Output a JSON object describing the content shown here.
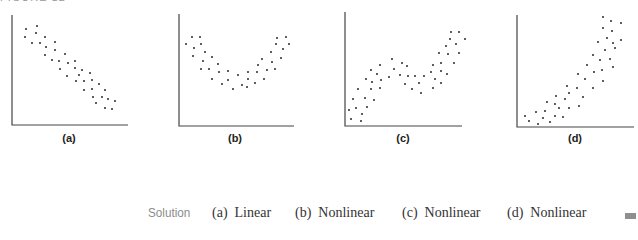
{
  "figure": {
    "title": "FIGURE 12"
  },
  "chart_data": [
    {
      "type": "scatter",
      "panel": "(a)",
      "title": "",
      "xlabel": "",
      "ylabel": "",
      "grid": false,
      "axis": {
        "origin": [
          12,
          125
        ],
        "x_end": 128,
        "y_top": 15
      },
      "trend": "negative linear",
      "points": [
        [
          26,
          29
        ],
        [
          37,
          26
        ],
        [
          25,
          37
        ],
        [
          36,
          33
        ],
        [
          32,
          43
        ],
        [
          40,
          43
        ],
        [
          45,
          37
        ],
        [
          46,
          47
        ],
        [
          55,
          42
        ],
        [
          45,
          55
        ],
        [
          55,
          50
        ],
        [
          52,
          60
        ],
        [
          59,
          61
        ],
        [
          65,
          54
        ],
        [
          68,
          63
        ],
        [
          75,
          61
        ],
        [
          60,
          69
        ],
        [
          75,
          68
        ],
        [
          82,
          70
        ],
        [
          67,
          76
        ],
        [
          79,
          75
        ],
        [
          90,
          73
        ],
        [
          76,
          81
        ],
        [
          84,
          81
        ],
        [
          92,
          80
        ],
        [
          99,
          84
        ],
        [
          84,
          90
        ],
        [
          92,
          89
        ],
        [
          105,
          90
        ],
        [
          93,
          97
        ],
        [
          102,
          97
        ],
        [
          108,
          99
        ],
        [
          115,
          101
        ],
        [
          96,
          103
        ],
        [
          105,
          108
        ],
        [
          112,
          109
        ]
      ]
    },
    {
      "type": "scatter",
      "panel": "(b)",
      "title": "",
      "xlabel": "",
      "ylabel": "",
      "grid": false,
      "axis": {
        "origin": [
          179,
          126
        ],
        "x_end": 294,
        "y_top": 14
      },
      "trend": "U-shaped (quadratic)",
      "points": [
        [
          186,
          44
        ],
        [
          192,
          37
        ],
        [
          200,
          37
        ],
        [
          194,
          48
        ],
        [
          201,
          44
        ],
        [
          193,
          56
        ],
        [
          205,
          52
        ],
        [
          203,
          61
        ],
        [
          212,
          57
        ],
        [
          201,
          69
        ],
        [
          209,
          69
        ],
        [
          218,
          64
        ],
        [
          219,
          72
        ],
        [
          228,
          71
        ],
        [
          212,
          79
        ],
        [
          228,
          80
        ],
        [
          222,
          84
        ],
        [
          238,
          75
        ],
        [
          248,
          72
        ],
        [
          257,
          72
        ],
        [
          233,
          89
        ],
        [
          242,
          85
        ],
        [
          247,
          87
        ],
        [
          248,
          79
        ],
        [
          255,
          83
        ],
        [
          258,
          65
        ],
        [
          262,
          59
        ],
        [
          264,
          79
        ],
        [
          267,
          70
        ],
        [
          272,
          62
        ],
        [
          271,
          52
        ],
        [
          275,
          69
        ],
        [
          281,
          58
        ],
        [
          276,
          44
        ],
        [
          283,
          49
        ],
        [
          277,
          38
        ],
        [
          286,
          37
        ],
        [
          289,
          44
        ]
      ]
    },
    {
      "type": "scatter",
      "panel": "(c)",
      "title": "",
      "xlabel": "",
      "ylabel": "",
      "grid": false,
      "axis": {
        "origin": [
          345,
          126
        ],
        "x_end": 462,
        "y_top": 12
      },
      "trend": "cubic-like (rise, plateau, rise)",
      "points": [
        [
          349,
          110
        ],
        [
          351,
          119
        ],
        [
          353,
          99
        ],
        [
          356,
          108
        ],
        [
          358,
          89
        ],
        [
          362,
          114
        ],
        [
          361,
          121
        ],
        [
          365,
          98
        ],
        [
          367,
          107
        ],
        [
          366,
          79
        ],
        [
          371,
          70
        ],
        [
          372,
          82
        ],
        [
          371,
          89
        ],
        [
          374,
          100
        ],
        [
          377,
          74
        ],
        [
          380,
          65
        ],
        [
          381,
          80
        ],
        [
          380,
          88
        ],
        [
          389,
          77
        ],
        [
          392,
          59
        ],
        [
          394,
          69
        ],
        [
          400,
          75
        ],
        [
          402,
          63
        ],
        [
          405,
          84
        ],
        [
          407,
          66
        ],
        [
          408,
          76
        ],
        [
          412,
          89
        ],
        [
          415,
          76
        ],
        [
          419,
          83
        ],
        [
          421,
          93
        ],
        [
          424,
          76
        ],
        [
          431,
          72
        ],
        [
          433,
          65
        ],
        [
          433,
          88
        ],
        [
          435,
          79
        ],
        [
          439,
          53
        ],
        [
          441,
          71
        ],
        [
          441,
          63
        ],
        [
          441,
          83
        ],
        [
          446,
          46
        ],
        [
          448,
          54
        ],
        [
          447,
          74
        ],
        [
          450,
          39
        ],
        [
          451,
          32
        ],
        [
          454,
          63
        ],
        [
          456,
          44
        ],
        [
          459,
          32
        ],
        [
          459,
          53
        ],
        [
          465,
          39
        ]
      ]
    },
    {
      "type": "scatter",
      "panel": "(d)",
      "title": "",
      "xlabel": "",
      "ylabel": "",
      "grid": false,
      "axis": {
        "origin": [
          517,
          127
        ],
        "x_end": 634,
        "y_top": 15
      },
      "trend": "exponential-like growth",
      "points": [
        [
          525,
          116
        ],
        [
          529,
          121
        ],
        [
          536,
          112
        ],
        [
          538,
          124
        ],
        [
          543,
          118
        ],
        [
          545,
          111
        ],
        [
          547,
          102
        ],
        [
          550,
          122
        ],
        [
          555,
          116
        ],
        [
          555,
          104
        ],
        [
          556,
          96
        ],
        [
          559,
          108
        ],
        [
          563,
          117
        ],
        [
          565,
          99
        ],
        [
          567,
          86
        ],
        [
          569,
          93
        ],
        [
          569,
          108
        ],
        [
          577,
          88
        ],
        [
          578,
          74
        ],
        [
          579,
          106
        ],
        [
          583,
          97
        ],
        [
          585,
          79
        ],
        [
          587,
          65
        ],
        [
          593,
          55
        ],
        [
          593,
          88
        ],
        [
          594,
          72
        ],
        [
          598,
          42
        ],
        [
          600,
          60
        ],
        [
          602,
          70
        ],
        [
          603,
          81
        ],
        [
          605,
          50
        ],
        [
          603,
          28
        ],
        [
          603,
          17
        ],
        [
          607,
          38
        ],
        [
          610,
          59
        ],
        [
          611,
          21
        ],
        [
          612,
          31
        ],
        [
          613,
          43
        ],
        [
          613,
          67
        ],
        [
          615,
          48
        ],
        [
          621,
          23
        ],
        [
          621,
          40
        ]
      ]
    }
  ],
  "panels": {
    "labels": [
      "(a)",
      "(b)",
      "(c)",
      "(d)"
    ],
    "label_centers_x": [
      69,
      235,
      403,
      575
    ]
  },
  "solution": {
    "heading": "Solution",
    "answers": [
      {
        "text": "(a)  Linear",
        "x": 212
      },
      {
        "text": "(b)  Nonlinear",
        "x": 295
      },
      {
        "text": "(c)  Nonlinear",
        "x": 402
      },
      {
        "text": "(d)  Nonlinear",
        "x": 507
      }
    ],
    "end_marker": "end-of-solution-square"
  },
  "colors": {
    "axis": "#444444",
    "point": "#1a1a1a",
    "heading": "#8c8c8c",
    "marker": "#8f8f8f"
  }
}
